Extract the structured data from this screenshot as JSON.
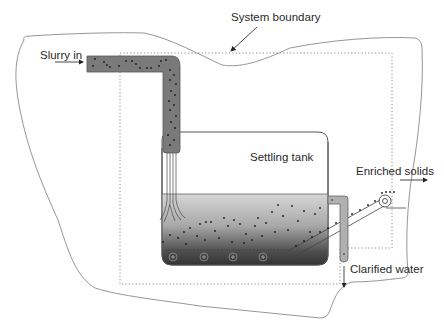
{
  "diagram": {
    "labels": {
      "system_boundary": "System boundary",
      "slurry_in": "Slurry in",
      "settling_tank": "Settling tank",
      "enriched_solids": "Enriched solids",
      "clarified_water": "Clarified water"
    },
    "colors": {
      "outline": "#555555",
      "boundary_outline": "#8a8a8a",
      "dotted_boundary": "#888888",
      "pipe_fill": "#7a7a7a",
      "pipe_particles": "#1e1e1e",
      "water_top": "#cfcfcf",
      "water_bottom": "#3a3a3a",
      "conveyor": "#4a4a4a"
    },
    "components": [
      {
        "id": "inlet-pipe",
        "label": "Slurry in"
      },
      {
        "id": "settling-tank",
        "label": "Settling tank"
      },
      {
        "id": "conveyor-belt",
        "rollers": 5
      },
      {
        "id": "overflow-outlet",
        "label": "Clarified water"
      },
      {
        "id": "solids-discharge",
        "label": "Enriched solids"
      }
    ]
  }
}
